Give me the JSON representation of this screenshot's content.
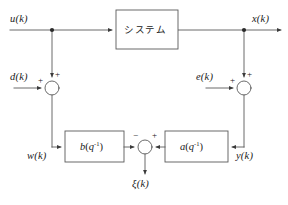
{
  "diagram": {
    "stroke_color": "#4a4a4a",
    "text_color": "#1a1a1a",
    "background": "#ffffff",
    "blocks": [
      {
        "id": "system",
        "label": "システム",
        "x": 116,
        "y": 10,
        "w": 62,
        "h": 39
      },
      {
        "id": "b-filter",
        "label_base": "b",
        "label_arg": "q",
        "label_exp": "-1",
        "x": 65,
        "y": 131,
        "w": 59,
        "h": 31
      },
      {
        "id": "a-filter",
        "label_base": "a",
        "label_arg": "q",
        "label_exp": "-1",
        "x": 165,
        "y": 131,
        "w": 63,
        "h": 31
      }
    ],
    "signals": {
      "u": "u(k)",
      "x": "x(k)",
      "d": "d(k)",
      "e": "e(k)",
      "w": "w(k)",
      "y": "y(k)",
      "xi": "ξ(k)"
    },
    "junctions": [
      {
        "id": "sum-d",
        "cx": 52,
        "cy": 88,
        "r": 7,
        "signs": [
          "+",
          "+"
        ]
      },
      {
        "id": "sum-e",
        "cx": 244,
        "cy": 88,
        "r": 7,
        "signs": [
          "+",
          "+"
        ]
      },
      {
        "id": "sum-xi",
        "cx": 145,
        "cy": 147,
        "r": 7,
        "signs": [
          "-",
          "+"
        ]
      }
    ],
    "signs": {
      "d_left": "+",
      "d_top": "+",
      "e_left": "+",
      "e_top": "+",
      "xi_minus": "−",
      "xi_plus": "+"
    },
    "nodes": [
      {
        "id": "tap-u",
        "x": 52,
        "y": 30
      },
      {
        "id": "tap-x",
        "x": 244,
        "y": 30
      }
    ],
    "main_line_y": 30
  }
}
